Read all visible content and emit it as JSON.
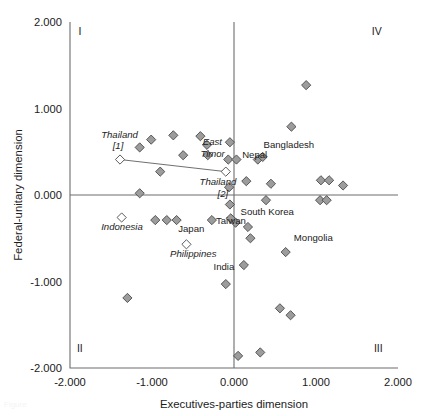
{
  "chart_data": {
    "type": "scatter",
    "title": "",
    "xlabel": "Executives-parties dimension",
    "ylabel": "Federal-unitary dimension",
    "xlim": [
      -2.0,
      2.0
    ],
    "ylim": [
      -2.0,
      2.0
    ],
    "xticks": [
      "-2.000",
      "-1.000",
      "0.000",
      "1.000",
      "2.000"
    ],
    "yticks": [
      "2.000",
      "1.000",
      "0.000",
      "-1.000",
      "-2.000"
    ],
    "xtick_values": [
      -2.0,
      -1.0,
      0.0,
      1.0,
      2.0
    ],
    "ytick_values": [
      2.0,
      1.0,
      0.0,
      -1.0,
      -2.0
    ],
    "grid": false,
    "legend": "none",
    "reference_lines": [
      {
        "orientation": "horizontal",
        "value": 0.0
      },
      {
        "orientation": "vertical",
        "value": 0.0
      }
    ],
    "quadrant_labels": [
      {
        "text": "I",
        "corner": "top-left",
        "x": -1.88,
        "y": 1.85
      },
      {
        "text": "IV",
        "corner": "top-right",
        "x": 1.74,
        "y": 1.85
      },
      {
        "text": "II",
        "corner": "bottom-left",
        "x": -1.88,
        "y": -1.82
      },
      {
        "text": "III",
        "corner": "bottom-right",
        "x": 1.76,
        "y": -1.82
      }
    ],
    "marker_styles": {
      "filled": "gray diamond",
      "open": "white diamond"
    },
    "connector": {
      "from_label": "Thailand [1]",
      "to_label": "Thailand [2]",
      "from": [
        -1.39,
        0.41
      ],
      "to": [
        -0.1,
        0.27
      ]
    },
    "points": [
      {
        "label": "",
        "x": -1.39,
        "y": 0.41,
        "style": "open",
        "name": "Thailand [1]"
      },
      {
        "label": "",
        "x": -1.01,
        "y": 0.64,
        "style": "filled"
      },
      {
        "label": "",
        "x": -1.15,
        "y": 0.55,
        "style": "filled"
      },
      {
        "label": "",
        "x": -1.3,
        "y": -1.19,
        "style": "filled"
      },
      {
        "label": "",
        "x": -1.37,
        "y": -0.26,
        "style": "open",
        "name": "Indonesia"
      },
      {
        "label": "",
        "x": -1.15,
        "y": 0.02,
        "style": "filled"
      },
      {
        "label": "",
        "x": -0.9,
        "y": 0.27,
        "style": "filled"
      },
      {
        "label": "",
        "x": -0.96,
        "y": -0.29,
        "style": "filled"
      },
      {
        "label": "",
        "x": -0.82,
        "y": -0.29,
        "style": "filled"
      },
      {
        "label": "",
        "x": -0.7,
        "y": -0.29,
        "style": "filled"
      },
      {
        "label": "",
        "x": -0.74,
        "y": 0.69,
        "style": "filled"
      },
      {
        "label": "",
        "x": -0.62,
        "y": 0.46,
        "style": "filled"
      },
      {
        "label": "",
        "x": -0.58,
        "y": -0.57,
        "style": "open",
        "name": "Philippines"
      },
      {
        "label": "",
        "x": -0.41,
        "y": 0.68,
        "style": "filled"
      },
      {
        "label": "",
        "x": -0.33,
        "y": 0.58,
        "style": "filled"
      },
      {
        "label": "",
        "x": -0.32,
        "y": 0.46,
        "style": "filled"
      },
      {
        "label": "",
        "x": -0.27,
        "y": -0.29,
        "style": "filled"
      },
      {
        "label": "",
        "x": -0.1,
        "y": 0.27,
        "style": "open",
        "name": "Thailand [2]"
      },
      {
        "label": "",
        "x": -0.07,
        "y": 0.41,
        "style": "filled"
      },
      {
        "label": "",
        "x": -0.06,
        "y": 0.09,
        "style": "filled"
      },
      {
        "label": "",
        "x": -0.05,
        "y": -0.11,
        "style": "filled"
      },
      {
        "label": "",
        "x": -0.04,
        "y": -0.27,
        "style": "filled"
      },
      {
        "label": "",
        "x": -0.1,
        "y": -1.03,
        "style": "filled",
        "name": "India"
      },
      {
        "label": "",
        "x": -0.05,
        "y": 0.61,
        "style": "filled"
      },
      {
        "label": "",
        "x": 0.03,
        "y": 0.41,
        "style": "filled",
        "name": "Nepal"
      },
      {
        "label": "",
        "x": 0.02,
        "y": -0.32,
        "style": "filled",
        "name": "Taiwan"
      },
      {
        "label": "",
        "x": 0.17,
        "y": -0.37,
        "style": "filled"
      },
      {
        "label": "",
        "x": 0.2,
        "y": -0.5,
        "style": "filled"
      },
      {
        "label": "",
        "x": 0.15,
        "y": 0.16,
        "style": "filled"
      },
      {
        "label": "",
        "x": 0.29,
        "y": 0.41,
        "style": "filled"
      },
      {
        "label": "",
        "x": 0.35,
        "y": 0.44,
        "style": "filled"
      },
      {
        "label": "",
        "x": 0.12,
        "y": -0.81,
        "style": "filled"
      },
      {
        "label": "",
        "x": 0.45,
        "y": 0.13,
        "style": "filled"
      },
      {
        "label": "",
        "x": 0.39,
        "y": -0.06,
        "style": "filled"
      },
      {
        "label": "",
        "x": 0.63,
        "y": -0.66,
        "style": "filled",
        "name": "Mongolia"
      },
      {
        "label": "",
        "x": 0.56,
        "y": -1.31,
        "style": "filled"
      },
      {
        "label": "",
        "x": 0.69,
        "y": -1.39,
        "style": "filled"
      },
      {
        "label": "",
        "x": 0.7,
        "y": 0.79,
        "style": "filled"
      },
      {
        "label": "",
        "x": 0.88,
        "y": 1.27,
        "style": "filled"
      },
      {
        "label": "",
        "x": 1.06,
        "y": 0.17,
        "style": "filled"
      },
      {
        "label": "",
        "x": 1.16,
        "y": 0.17,
        "style": "filled"
      },
      {
        "label": "",
        "x": 1.05,
        "y": -0.06,
        "style": "filled"
      },
      {
        "label": "",
        "x": 1.13,
        "y": -0.06,
        "style": "filled"
      },
      {
        "label": "",
        "x": 1.33,
        "y": 0.11,
        "style": "filled"
      },
      {
        "label": "",
        "x": 0.32,
        "y": -1.82,
        "style": "filled"
      },
      {
        "label": "",
        "x": 0.05,
        "y": -1.86,
        "style": "filled"
      }
    ],
    "point_labels": [
      {
        "text": "Thailand",
        "x": -1.62,
        "y": 0.66,
        "style": "italic",
        "anchor": "start"
      },
      {
        "text": "[1]",
        "x": -1.48,
        "y": 0.53,
        "style": "italic",
        "anchor": "start"
      },
      {
        "text": "East",
        "x": -0.38,
        "y": 0.58,
        "style": "italic",
        "anchor": "start"
      },
      {
        "text": "Timor",
        "x": -0.41,
        "y": 0.44,
        "style": "italic",
        "anchor": "start"
      },
      {
        "text": "Thailand",
        "x": -0.42,
        "y": 0.12,
        "style": "italic",
        "anchor": "start"
      },
      {
        "text": "[2]",
        "x": -0.2,
        "y": -0.02,
        "style": "italic",
        "anchor": "start"
      },
      {
        "text": "Nepal",
        "x": 0.1,
        "y": 0.43,
        "style": "normal",
        "anchor": "start"
      },
      {
        "text": "Bangladesh",
        "x": 0.36,
        "y": 0.54,
        "style": "normal",
        "anchor": "start"
      },
      {
        "text": "South Korea",
        "x": 0.08,
        "y": -0.23,
        "style": "normal",
        "anchor": "start"
      },
      {
        "text": "Taiwan",
        "x": -0.22,
        "y": -0.34,
        "style": "normal",
        "anchor": "start"
      },
      {
        "text": "Indonesia",
        "x": -1.62,
        "y": -0.41,
        "style": "italic",
        "anchor": "start"
      },
      {
        "text": "Japan",
        "x": -0.68,
        "y": -0.43,
        "style": "normal",
        "anchor": "start"
      },
      {
        "text": "Philippines",
        "x": -0.78,
        "y": -0.72,
        "style": "italic",
        "anchor": "start"
      },
      {
        "text": "India",
        "x": -0.25,
        "y": -0.87,
        "style": "normal",
        "anchor": "start"
      },
      {
        "text": "Mongolia",
        "x": 0.73,
        "y": -0.53,
        "style": "normal",
        "anchor": "start"
      }
    ]
  },
  "caption": {
    "text": "Figure"
  }
}
